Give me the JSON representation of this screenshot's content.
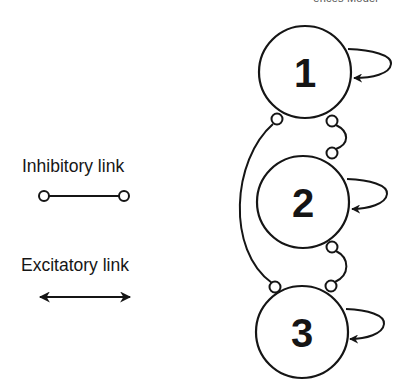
{
  "header": {
    "clipped_text": "· · · ences Model · ·"
  },
  "legend": {
    "inhibitory": {
      "label": "Inhibitory link",
      "symbol": "line-with-open-circle-ends"
    },
    "excitatory": {
      "label": "Excitatory link",
      "symbol": "double-headed-arrow"
    }
  },
  "nodes": [
    {
      "id": "1",
      "label": "1",
      "cx": 305,
      "cy": 72,
      "r": 46
    },
    {
      "id": "2",
      "label": "2",
      "cx": 303,
      "cy": 202,
      "r": 46
    },
    {
      "id": "3",
      "label": "3",
      "cx": 302,
      "cy": 332,
      "r": 46
    }
  ],
  "links": [
    {
      "type": "excitatory-self-loop",
      "node": "1"
    },
    {
      "type": "excitatory-self-loop",
      "node": "2"
    },
    {
      "type": "excitatory-self-loop",
      "node": "3"
    },
    {
      "type": "inhibitory",
      "from": "1",
      "to": "2",
      "side": "right"
    },
    {
      "type": "inhibitory",
      "from": "2",
      "to": "3",
      "side": "right"
    },
    {
      "type": "inhibitory",
      "from": "1",
      "to": "3",
      "side": "left-arc"
    }
  ],
  "colors": {
    "stroke": "#151515",
    "background": "#ffffff"
  }
}
